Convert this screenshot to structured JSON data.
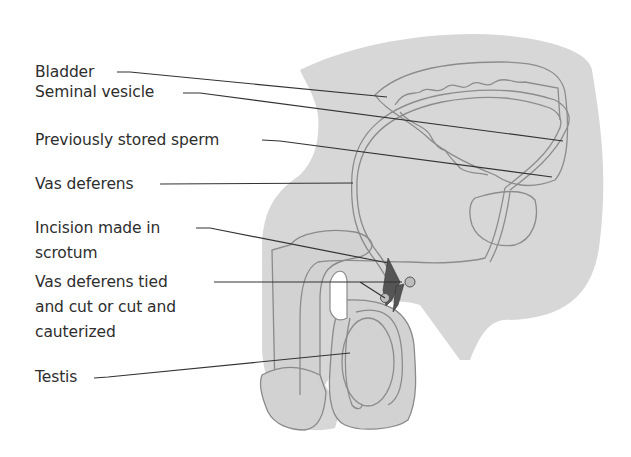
{
  "figure": {
    "type": "anatomical-diagram",
    "colors": {
      "background": "#ffffff",
      "body_fill": "#d7d7d7",
      "organ_outline": "#8c8c8c",
      "leader_line": "#333333",
      "label_text": "#2e2e2e",
      "incision_dark": "#555555"
    }
  },
  "labels": [
    {
      "id": "bladder",
      "text": "Bladder"
    },
    {
      "id": "seminal-vesicle",
      "text": "Seminal vesicle"
    },
    {
      "id": "previously-stored-sperm",
      "text": "Previously stored sperm"
    },
    {
      "id": "vas-deferens",
      "text": "Vas deferens"
    },
    {
      "id": "incision",
      "text": "Incision made in\nscrotum"
    },
    {
      "id": "vas-tied",
      "text": "Vas deferens tied\nand cut or cut and\ncauterized"
    },
    {
      "id": "testis",
      "text": "Testis"
    }
  ]
}
